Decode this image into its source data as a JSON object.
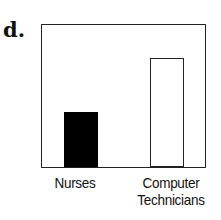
{
  "panel": {
    "label": "d."
  },
  "chart_data": {
    "type": "bar",
    "title": "",
    "xlabel": "",
    "ylabel": "",
    "categories": [
      "Nurses",
      "Computer Technicians"
    ],
    "category_lines": [
      [
        "Nurses"
      ],
      [
        "Computer",
        "Technicians"
      ]
    ],
    "values": [
      39,
      77
    ],
    "value_units": "percent of frame height (no axis shown)",
    "ylim": [
      0,
      100
    ],
    "grid": false,
    "legend": null,
    "colors": [
      "#000000",
      "#ffffff"
    ],
    "axis_ticks_shown": false
  }
}
